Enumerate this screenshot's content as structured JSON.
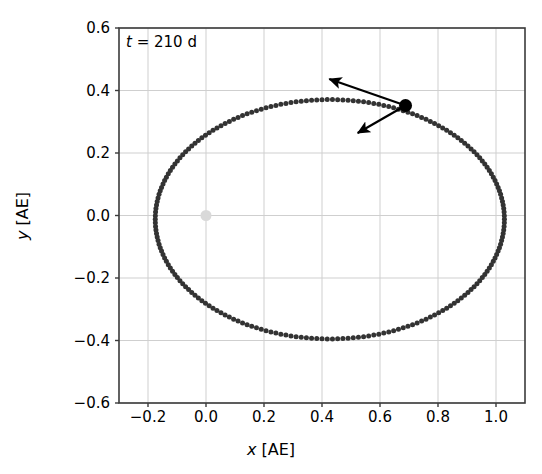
{
  "chart_data": {
    "type": "scatter",
    "title": "",
    "xlabel": "x [AE]",
    "ylabel": "y [AE]",
    "xlim": [
      -0.3,
      1.1
    ],
    "ylim": [
      -0.6,
      0.6
    ],
    "xticks": [
      -0.2,
      0.0,
      0.2,
      0.4,
      0.6,
      0.8,
      1.0
    ],
    "xtick_labels": [
      "−0.2",
      "0.0",
      "0.2",
      "0.4",
      "0.6",
      "0.8",
      "1.0"
    ],
    "yticks": [
      -0.6,
      -0.4,
      -0.2,
      0.0,
      0.2,
      0.4,
      0.6
    ],
    "ytick_labels": [
      "−0.6",
      "−0.4",
      "−0.2",
      "0.0",
      "0.2",
      "0.4",
      "0.6"
    ],
    "grid": true,
    "legend": "none",
    "annotation": "t = 210 d",
    "annotation_time_value": 210,
    "annotation_time_unit": "d",
    "series": [
      {
        "name": "orbit-trace",
        "marker": "circle",
        "color": "#333333",
        "marker_size": 5.0,
        "ellipse": {
          "center_x": 0.427,
          "center_y": -0.012,
          "semi_major_x": 0.602,
          "semi_minor_y": 0.383,
          "n_points": 210
        }
      },
      {
        "name": "central-body",
        "marker": "circle",
        "color": "#d9d9d9",
        "marker_size": 11,
        "points": [
          [
            0.0,
            0.0
          ]
        ]
      },
      {
        "name": "orbiting-body",
        "marker": "circle",
        "color": "#000000",
        "marker_size": 13,
        "points": [
          [
            0.688,
            0.352
          ]
        ]
      }
    ],
    "arrows": [
      {
        "name": "velocity-arrow",
        "start_x": 0.688,
        "start_y": 0.352,
        "end_x": 0.425,
        "end_y": 0.437,
        "color": "#000000"
      },
      {
        "name": "acceleration-arrow",
        "start_x": 0.688,
        "start_y": 0.352,
        "end_x": 0.523,
        "end_y": 0.264,
        "color": "#000000"
      }
    ]
  },
  "axes": {
    "xlabel_text": "[AE]",
    "xlabel_var": "x",
    "ylabel_text": "[AE]",
    "ylabel_var": "y"
  },
  "annotation": {
    "var": "t",
    "rest": " = 210 d"
  }
}
